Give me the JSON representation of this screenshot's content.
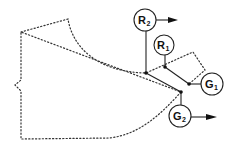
{
  "diagram": {
    "nodes": [
      {
        "id": "R2",
        "main": "R",
        "sub": "2",
        "cx": 145,
        "cy": 20,
        "r": 11,
        "has_arrow": true
      },
      {
        "id": "R1",
        "main": "R",
        "sub": "1",
        "cx": 164,
        "cy": 45,
        "r": 10,
        "has_arrow": false
      },
      {
        "id": "G1",
        "main": "G",
        "sub": "1",
        "cx": 212,
        "cy": 84,
        "r": 11,
        "has_arrow": false
      },
      {
        "id": "G2",
        "main": "G",
        "sub": "2",
        "cx": 180,
        "cy": 116,
        "r": 11,
        "has_arrow": true
      }
    ],
    "joints": [
      {
        "x": 146,
        "y": 73
      },
      {
        "x": 165,
        "y": 67
      },
      {
        "x": 189,
        "y": 84
      },
      {
        "x": 181,
        "y": 92
      }
    ],
    "colors": {
      "stroke": "#222222",
      "background": "#ffffff"
    }
  }
}
